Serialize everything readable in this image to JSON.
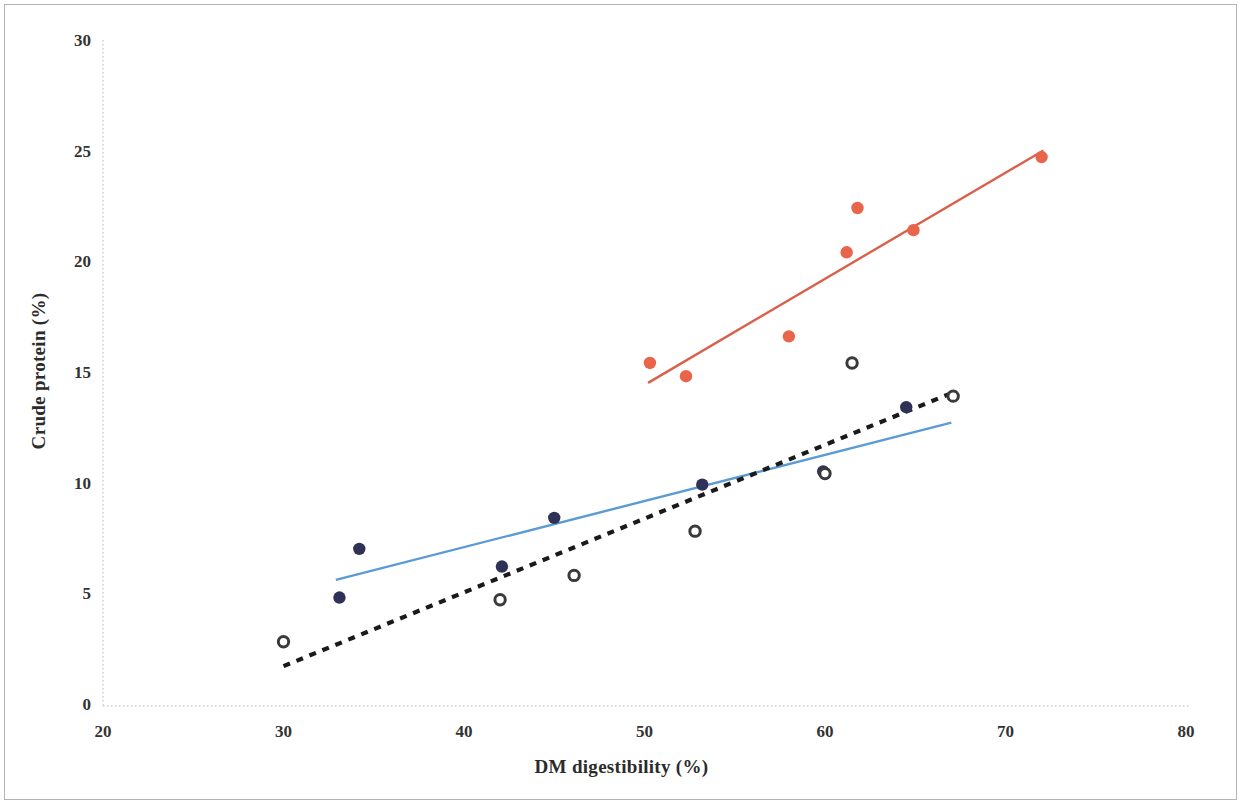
{
  "figure": {
    "border_color": "#b4b4b4",
    "background": "#ffffff"
  },
  "axes": {
    "x_title": "DM digestibility (%)",
    "y_title": "Crude protein (%)",
    "x_ticks": [
      "20",
      "30",
      "40",
      "50",
      "60",
      "70",
      "80"
    ],
    "y_ticks": [
      "0",
      "5",
      "10",
      "15",
      "20",
      "25",
      "30"
    ],
    "x_axis_color": "#cfcfcf",
    "y_axis_color": "#cfcfcf",
    "tick_label_color": "#333333"
  },
  "chart_data": {
    "type": "scatter",
    "title": "",
    "xlabel": "DM digestibility (%)",
    "ylabel": "Crude protein (%)",
    "xlim": [
      20,
      80
    ],
    "ylim": [
      0,
      30
    ],
    "x_ticks": [
      20,
      30,
      40,
      50,
      60,
      70,
      80
    ],
    "y_ticks": [
      0,
      5,
      10,
      15,
      20,
      25,
      30
    ],
    "grid": false,
    "legend": null,
    "series": [
      {
        "name": "red-series",
        "marker": "filled-circle",
        "color": "#e8654c",
        "points": [
          {
            "x": 50.3,
            "y": 15.5
          },
          {
            "x": 52.3,
            "y": 14.9
          },
          {
            "x": 58.0,
            "y": 16.7
          },
          {
            "x": 61.2,
            "y": 20.5
          },
          {
            "x": 61.8,
            "y": 22.5
          },
          {
            "x": 64.9,
            "y": 21.5
          },
          {
            "x": 72.0,
            "y": 24.8
          }
        ],
        "trendline": {
          "style": "solid",
          "color": "#d9604a",
          "x_start": 50.2,
          "y_start": 14.6,
          "x_end": 72.1,
          "y_end": 25.1
        }
      },
      {
        "name": "navy-series",
        "marker": "filled-circle",
        "color": "#2f3256",
        "points": [
          {
            "x": 33.1,
            "y": 4.9
          },
          {
            "x": 34.2,
            "y": 7.1
          },
          {
            "x": 42.1,
            "y": 6.3
          },
          {
            "x": 45.0,
            "y": 8.5
          },
          {
            "x": 53.2,
            "y": 10.0
          },
          {
            "x": 59.9,
            "y": 10.6
          },
          {
            "x": 64.5,
            "y": 13.5
          }
        ],
        "trendline": {
          "style": "solid",
          "color": "#5b9bd5",
          "x_start": 32.9,
          "y_start": 5.7,
          "x_end": 67.0,
          "y_end": 12.8
        }
      },
      {
        "name": "open-series",
        "marker": "open-circle",
        "color": "#3a3a3a",
        "points": [
          {
            "x": 30.0,
            "y": 2.9
          },
          {
            "x": 42.0,
            "y": 4.8
          },
          {
            "x": 46.1,
            "y": 5.9
          },
          {
            "x": 52.8,
            "y": 7.9
          },
          {
            "x": 60.0,
            "y": 10.5
          },
          {
            "x": 61.5,
            "y": 15.5
          },
          {
            "x": 67.1,
            "y": 14.0
          }
        ],
        "trendline": {
          "style": "dashed",
          "color": "#1a1a1a",
          "x_start": 30.0,
          "y_start": 1.8,
          "x_end": 67.2,
          "y_end": 14.2
        }
      }
    ]
  }
}
